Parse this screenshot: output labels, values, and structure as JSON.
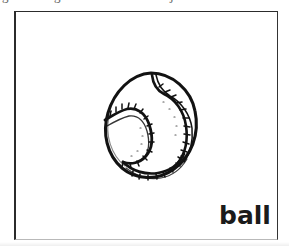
{
  "page": {
    "width": 289,
    "height": 246,
    "background_color": "#ffffff",
    "kind": "scanned-flashcard-page"
  },
  "clipped_header_fragments": {
    "description": "bottom slivers of a text line cut off above the crop",
    "parts": [
      {
        "name": "fragment-1",
        "text": "g"
      },
      {
        "name": "fragment-2",
        "text": "g"
      },
      {
        "name": "fragment-3",
        "text": "j"
      },
      {
        "name": "fragment-4",
        "text": "c"
      }
    ]
  },
  "card": {
    "frame": {
      "border_color": "#2c2c2c",
      "bottom_border_color": "#b9b9b9",
      "fill_color": "#ffffff",
      "x": 14,
      "y": 11,
      "width": 264,
      "height": 229
    },
    "illustration": {
      "name": "ball-drawing",
      "subject": "ball",
      "style": "hand-drawn black ink line art",
      "detail": "round ball with S-curved double seam and short stitch hatch marks",
      "stroke_color": "#121212",
      "fill_color": "#ffffff",
      "x": 80,
      "y": 52,
      "width": 108,
      "height": 120
    },
    "label": {
      "name": "word-ball",
      "text": "ball",
      "color": "#1b1b1b",
      "align": "bottom-right"
    }
  }
}
